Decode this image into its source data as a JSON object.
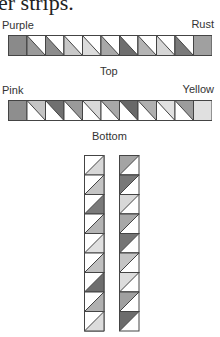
{
  "heading": "er strips.",
  "top_strip": {
    "left_label": "Purple",
    "right_label": "Rust",
    "caption": "Top",
    "end_squares": [
      "#8a8a8a",
      "#a0a0a0"
    ],
    "triangle_fills": [
      "#9a9a9a",
      "#8c8c8c",
      "#c8c8c8",
      "#dcdcdc",
      "#a8a8a8",
      "#6e6e6e",
      "#b4b4b4",
      "#d6d6d6",
      "#7a7a7a"
    ]
  },
  "bottom_strip": {
    "left_label": "Pink",
    "right_label": "Yellow",
    "caption": "Bottom",
    "end_squares": [
      "#8e8e8e",
      "#e0e0e0"
    ],
    "triangle_fills": [
      "#c4c4c4",
      "#707070",
      "#9a9a9a",
      "#d8d8d8",
      "#a8a8a8",
      "#686868",
      "#b0b0b0",
      "#e0e0e0",
      "#9c9c9c"
    ]
  },
  "vertical_strips": {
    "left_fills": [
      "#d8d8d8",
      "#c4c4c4",
      "#7a7a7a",
      "#b4b4b4",
      "#e0e0e0",
      "#c0c0c0",
      "#6e6e6e",
      "#b0b0b0",
      "#dcdcdc"
    ],
    "right_fills": [
      "#a4a4a4",
      "#787878",
      "#d8d8d8",
      "#a8a8a8",
      "#747474",
      "#c4c4c4",
      "#dcdcdc",
      "#a0a0a0",
      "#6c6c6c"
    ]
  }
}
